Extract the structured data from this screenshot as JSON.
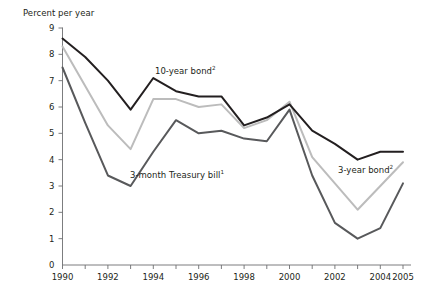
{
  "header": {
    "truncated_top_text": ""
  },
  "axis": {
    "y_title": "Percent per year",
    "y_ticks": [
      "0",
      "1",
      "2",
      "3",
      "4",
      "5",
      "6",
      "7",
      "8",
      "9"
    ],
    "x_ticks_labeled": [
      "1990",
      "1992",
      "1994",
      "1996",
      "1998",
      "2000",
      "2002",
      "2004",
      "2005"
    ]
  },
  "labels": {
    "ten_year": "10-year bond",
    "ten_year_sup": "2",
    "three_month": "3-month Treasury bill",
    "three_month_sup": "1",
    "three_year": "3-year bond",
    "three_year_sup": "2"
  },
  "colors": {
    "ten_year": "#231f20",
    "three_year": "#bcbcbc",
    "three_month": "#58595b",
    "axis": "#6d6e71"
  },
  "chart_data": {
    "type": "line",
    "title": "",
    "xlabel": "",
    "ylabel": "Percent per year",
    "xlim": [
      1990,
      2005
    ],
    "ylim": [
      0,
      9
    ],
    "grid": false,
    "legend": "inline-annotations",
    "x": [
      1990,
      1991,
      1992,
      1993,
      1994,
      1995,
      1996,
      1997,
      1998,
      1999,
      2000,
      2001,
      2002,
      2003,
      2004,
      2005
    ],
    "series": [
      {
        "name": "10-year bond",
        "color": "#231f20",
        "values": [
          8.6,
          7.9,
          7.0,
          5.9,
          7.1,
          6.6,
          6.4,
          6.4,
          5.3,
          5.6,
          6.1,
          5.1,
          4.6,
          4.0,
          4.3,
          4.3
        ]
      },
      {
        "name": "3-year bond",
        "color": "#bcbcbc",
        "values": [
          8.3,
          6.8,
          5.3,
          4.4,
          6.3,
          6.3,
          6.0,
          6.1,
          5.2,
          5.5,
          6.2,
          4.1,
          3.1,
          2.1,
          3.0,
          3.9
        ]
      },
      {
        "name": "3-month Treasury bill",
        "color": "#58595b",
        "values": [
          7.5,
          5.4,
          3.4,
          3.0,
          4.3,
          5.5,
          5.0,
          5.1,
          4.8,
          4.7,
          5.9,
          3.4,
          1.6,
          1.0,
          1.4,
          3.1
        ]
      }
    ]
  }
}
